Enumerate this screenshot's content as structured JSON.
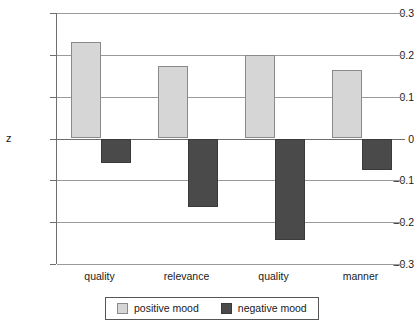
{
  "chart_data": {
    "type": "bar",
    "title": "",
    "subtitle": "",
    "xlabel": "",
    "ylabel": "z",
    "categories": [
      "quality",
      "relevance",
      "quality",
      "manner"
    ],
    "series": [
      {
        "name": "positive mood",
        "color": "#d6d6d6",
        "values": [
          0.23,
          0.173,
          0.2,
          0.164
        ]
      },
      {
        "name": "negative mood",
        "color": "#4a4a4a",
        "values": [
          -0.058,
          -0.164,
          -0.243,
          -0.076
        ]
      }
    ],
    "ylim": [
      -0.3,
      0.3
    ],
    "ytick_values": [
      0.3,
      0.2,
      0.1,
      0,
      -0.1,
      -0.2,
      -0.3
    ],
    "ytick_labels": [
      "0.3",
      "0.2",
      "0.1",
      "0",
      "–0.1",
      "–0.2",
      "–0.3"
    ],
    "grid": true,
    "grid_axis": "y",
    "legend_position": "bottom",
    "legend_entries": [
      "positive mood",
      "negative mood"
    ]
  }
}
